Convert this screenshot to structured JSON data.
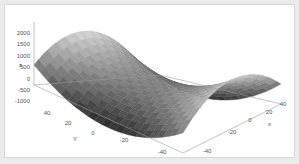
{
  "chart_data": {
    "type": "surface",
    "title": "",
    "function": "z = x^2 - y^2",
    "xlabel": "x",
    "ylabel": "Y",
    "zlabel": "z",
    "x_ticks": [
      -40,
      -20,
      0,
      20,
      40
    ],
    "y_ticks": [
      -40,
      -20,
      0,
      20,
      40
    ],
    "z_ticks": [
      -1000,
      -500,
      0,
      500,
      1000,
      1500,
      2000
    ],
    "xlim": [
      -40,
      40
    ],
    "ylim": [
      -40,
      40
    ],
    "zlim": [
      -1600,
      1600
    ],
    "grid": false,
    "colormap": "grayscale",
    "legend": null,
    "view": "saddle viewed from front corner (x=-40,y=-40)"
  },
  "axes": {
    "z_tick_labels": [
      "2000",
      "1500",
      "1000",
      "500",
      "0",
      "-500",
      "-1000"
    ],
    "y_tick_labels": [
      "40",
      "20",
      "0",
      "-20",
      "-40"
    ],
    "x_tick_labels": [
      "-40",
      "-20",
      "0",
      "20",
      "40"
    ],
    "x_label": "x",
    "y_label": "Y",
    "z_label": "z"
  }
}
